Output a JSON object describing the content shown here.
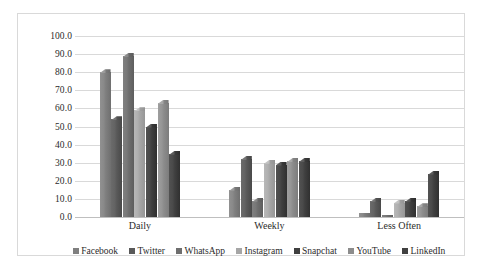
{
  "chart_data": {
    "type": "bar",
    "title": "",
    "subtitle": "",
    "xlabel": "",
    "ylabel": "",
    "categories": [
      "Daily",
      "Weekly",
      "Less Often"
    ],
    "ylim": [
      0,
      100
    ],
    "ytick_labels": [
      "100.0",
      "90.0",
      "80.0",
      "70.0",
      "60.0",
      "50.0",
      "40.0",
      "30.0",
      "20.0",
      "10.0",
      "0.0"
    ],
    "ytick_values": [
      100,
      90,
      80,
      70,
      60,
      50,
      40,
      30,
      20,
      10,
      0
    ],
    "grid": true,
    "legend_position": "bottom",
    "series": [
      {
        "name": "Facebook",
        "color": "#7f7f7f",
        "values": [
          80,
          15,
          2
        ]
      },
      {
        "name": "Twitter",
        "color": "#595959",
        "values": [
          54,
          32,
          9
        ]
      },
      {
        "name": "WhatsApp",
        "color": "#6e6e6e",
        "values": [
          89,
          9,
          1
        ]
      },
      {
        "name": "Instagram",
        "color": "#a6a6a6",
        "values": [
          59,
          30,
          8
        ]
      },
      {
        "name": "Snapchat",
        "color": "#3f3f3f",
        "values": [
          50,
          29,
          9
        ]
      },
      {
        "name": "YouTube",
        "color": "#8c8c8c",
        "values": [
          63,
          31,
          6
        ]
      },
      {
        "name": "LinkedIn",
        "color": "#404040",
        "values": [
          35,
          31,
          24
        ]
      }
    ]
  },
  "colors": {
    "grid": "#d9d9d9",
    "axis": "#bfbfbf",
    "frame": "#d9d9d9",
    "text": "#2b2b2b",
    "background": "#ffffff"
  }
}
